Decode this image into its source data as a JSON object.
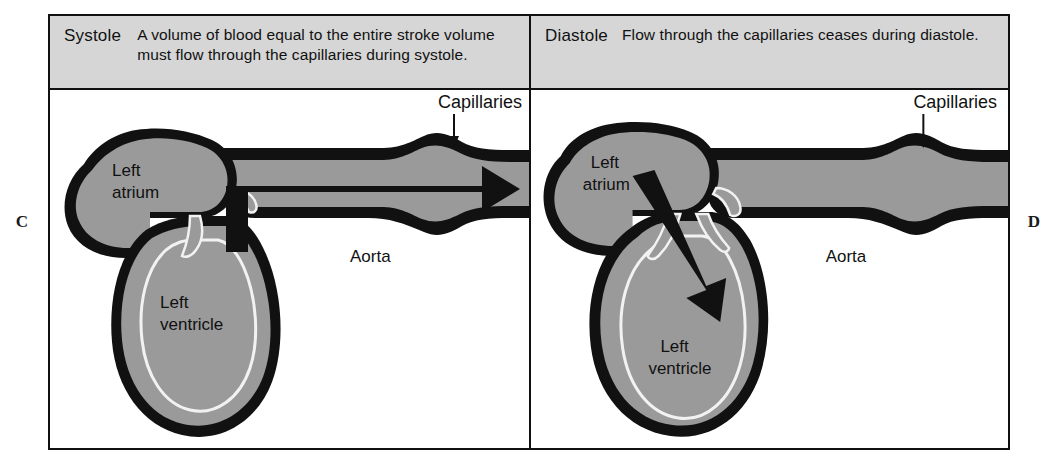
{
  "figure": {
    "letters": {
      "left": "C",
      "right": "D"
    }
  },
  "panels": [
    {
      "id": "systole",
      "letter": "C",
      "phase": "Systole",
      "caption": "A volume of blood equal to the entire stroke volume must flow through the capillaries during systole.",
      "labels": {
        "capillaries": "Capillaries",
        "aorta": "Aorta",
        "atrium": "Left\natrium",
        "atrium_line1": "Left",
        "atrium_line2": "atrium",
        "ventricle_line1": "Left",
        "ventricle_line2": "ventricle"
      },
      "flow": {
        "description": "Thick black arrow from left ventricle up through aorta and on through the capillaries",
        "direction": "ventricle-to-capillaries",
        "arrow_present": true
      }
    },
    {
      "id": "diastole",
      "letter": "D",
      "phase": "Diastole",
      "caption": "Flow through the capillaries ceases during diastole.",
      "labels": {
        "capillaries": "Capillaries",
        "aorta": "Aorta",
        "atrium_line1": "Left",
        "atrium_line2": "atrium",
        "ventricle_line1": "Left",
        "ventricle_line2": "ventricle"
      },
      "flow": {
        "description": "Thick black arrow from left atrium down into left ventricle; no flow arrow in aorta or capillaries",
        "direction": "atrium-to-ventricle",
        "arrow_present": true
      }
    }
  ],
  "colors": {
    "caption_band": "#d6d6d6",
    "tissue_fill": "#9a9a9a",
    "outline": "#111111",
    "lumen": "#9a9a9a",
    "page": "#ffffff"
  }
}
